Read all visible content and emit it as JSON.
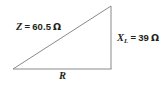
{
  "figure": {
    "type": "impedance-right-triangle",
    "background_color": "#ffffff",
    "line_color": "#8a8a8a",
    "text_color": "#231f20"
  },
  "geometry": {
    "left_vertex": [
      13,
      69
    ],
    "top_right_vertex": [
      111,
      6
    ],
    "bottom_right_vertex": [
      111,
      69
    ]
  },
  "labels": {
    "hypotenuse": {
      "symbol": "Z",
      "equals": "=",
      "value": "60.5",
      "unit": "Ω",
      "full_text": "Z = 60.5 Ω"
    },
    "vertical_leg": {
      "symbol": "X",
      "subscript": "L",
      "equals": "=",
      "value": "39",
      "unit": "Ω",
      "full_text": "X_L = 39 Ω"
    },
    "horizontal_leg": {
      "symbol": "R",
      "full_text": "R"
    }
  }
}
